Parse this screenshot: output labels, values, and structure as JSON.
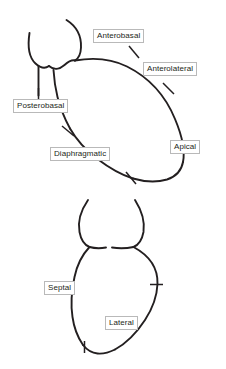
{
  "figure": {
    "stroke_color": "#231f20",
    "label_border_color": "#b9b9b9",
    "label_fill_color": "#ffffff",
    "background_color": "#ffffff"
  },
  "panels": [
    {
      "id": "upper",
      "name": "anterior-view-heart-outline",
      "labels": [
        {
          "id": "anterobasal",
          "text": "Anterobasal"
        },
        {
          "id": "anterolateral",
          "text": "Anterolateral"
        },
        {
          "id": "apical",
          "text": "Apical"
        },
        {
          "id": "diaphragmatic",
          "text": "Diaphragmatic"
        },
        {
          "id": "posterobasal",
          "text": "Posterobasal"
        }
      ]
    },
    {
      "id": "lower",
      "name": "frontal-view-heart-outline",
      "labels": [
        {
          "id": "septal",
          "text": "Septal"
        },
        {
          "id": "lateral",
          "text": "Lateral"
        }
      ]
    }
  ]
}
